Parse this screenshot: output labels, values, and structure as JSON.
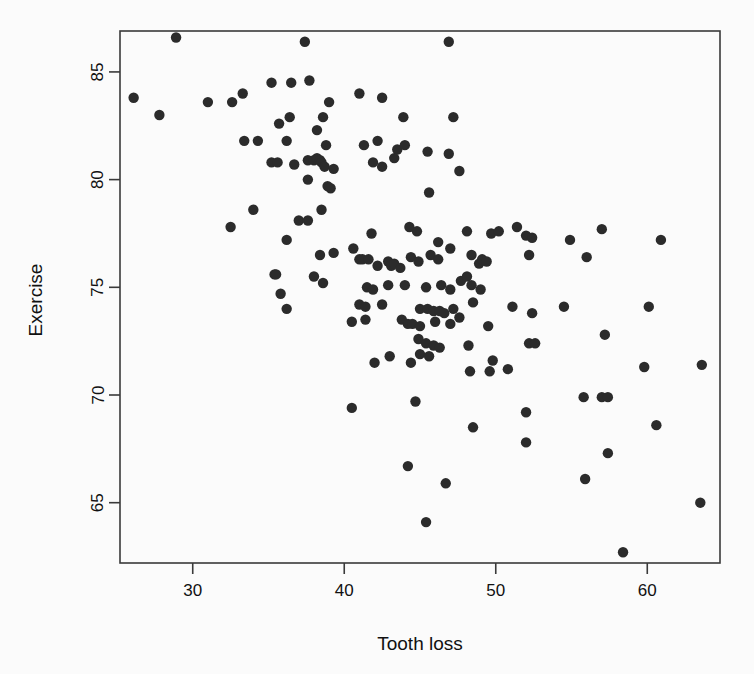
{
  "chart_data": {
    "type": "scatter",
    "title": "",
    "xlabel": "Tooth loss",
    "ylabel": "Exercise",
    "xlim": [
      25.2,
      64.8
    ],
    "ylim": [
      62.2,
      86.9
    ],
    "grid": false,
    "legend": null,
    "xticks": [
      30,
      40,
      50,
      60
    ],
    "yticks": [
      65,
      70,
      75,
      80,
      85
    ],
    "xtick_labels": [
      "30",
      "40",
      "50",
      "60"
    ],
    "ytick_labels": [
      "65",
      "70",
      "75",
      "80",
      "85"
    ],
    "marker": {
      "shape": "circle",
      "color": "#2b2b2b",
      "size": 5.2
    },
    "points": [
      [
        28.9,
        86.6
      ],
      [
        37.4,
        86.4
      ],
      [
        46.9,
        86.4
      ],
      [
        26.1,
        83.8
      ],
      [
        31.0,
        83.6
      ],
      [
        32.6,
        83.6
      ],
      [
        33.3,
        84.0
      ],
      [
        35.2,
        84.5
      ],
      [
        36.5,
        84.5
      ],
      [
        37.7,
        84.6
      ],
      [
        39.0,
        83.6
      ],
      [
        41.0,
        84.0
      ],
      [
        42.5,
        83.8
      ],
      [
        27.8,
        83.0
      ],
      [
        35.7,
        82.6
      ],
      [
        36.4,
        82.9
      ],
      [
        38.2,
        82.3
      ],
      [
        38.6,
        82.9
      ],
      [
        43.9,
        82.9
      ],
      [
        47.2,
        82.9
      ],
      [
        33.4,
        81.8
      ],
      [
        34.3,
        81.8
      ],
      [
        36.2,
        81.8
      ],
      [
        38.8,
        81.6
      ],
      [
        41.3,
        81.6
      ],
      [
        42.2,
        81.8
      ],
      [
        43.5,
        81.4
      ],
      [
        44.0,
        81.6
      ],
      [
        45.5,
        81.3
      ],
      [
        46.9,
        81.2
      ],
      [
        35.2,
        80.8
      ],
      [
        35.6,
        80.8
      ],
      [
        36.7,
        80.7
      ],
      [
        37.6,
        80.9
      ],
      [
        38.0,
        80.9
      ],
      [
        38.2,
        81.0
      ],
      [
        38.4,
        80.9
      ],
      [
        38.5,
        80.8
      ],
      [
        38.7,
        80.6
      ],
      [
        39.3,
        80.5
      ],
      [
        41.9,
        80.8
      ],
      [
        42.5,
        80.6
      ],
      [
        43.3,
        81.0
      ],
      [
        47.6,
        80.4
      ],
      [
        37.6,
        80.0
      ],
      [
        38.9,
        79.7
      ],
      [
        39.1,
        79.6
      ],
      [
        45.6,
        79.4
      ],
      [
        34.0,
        78.6
      ],
      [
        38.5,
        78.6
      ],
      [
        37.0,
        78.1
      ],
      [
        37.6,
        78.1
      ],
      [
        32.5,
        77.8
      ],
      [
        36.2,
        77.2
      ],
      [
        41.8,
        77.5
      ],
      [
        44.3,
        77.8
      ],
      [
        44.8,
        77.6
      ],
      [
        46.2,
        77.1
      ],
      [
        48.1,
        77.6
      ],
      [
        49.7,
        77.5
      ],
      [
        50.2,
        77.6
      ],
      [
        51.4,
        77.8
      ],
      [
        52.0,
        77.4
      ],
      [
        52.4,
        77.3
      ],
      [
        54.9,
        77.2
      ],
      [
        57.0,
        77.7
      ],
      [
        60.9,
        77.2
      ],
      [
        35.4,
        75.6
      ],
      [
        35.5,
        75.6
      ],
      [
        38.0,
        75.5
      ],
      [
        38.4,
        76.5
      ],
      [
        39.3,
        76.6
      ],
      [
        40.6,
        76.8
      ],
      [
        41.0,
        76.3
      ],
      [
        41.2,
        76.3
      ],
      [
        41.6,
        76.3
      ],
      [
        42.2,
        76.0
      ],
      [
        42.9,
        76.2
      ],
      [
        43.1,
        76.0
      ],
      [
        43.3,
        76.1
      ],
      [
        43.7,
        75.9
      ],
      [
        44.4,
        76.4
      ],
      [
        44.9,
        76.2
      ],
      [
        45.7,
        76.5
      ],
      [
        46.2,
        76.3
      ],
      [
        47.0,
        76.8
      ],
      [
        48.4,
        76.5
      ],
      [
        48.9,
        76.1
      ],
      [
        49.1,
        76.3
      ],
      [
        49.4,
        76.2
      ],
      [
        52.2,
        76.5
      ],
      [
        56.0,
        76.4
      ],
      [
        38.6,
        75.2
      ],
      [
        41.5,
        75.0
      ],
      [
        41.9,
        74.9
      ],
      [
        42.9,
        75.1
      ],
      [
        44.0,
        75.1
      ],
      [
        45.4,
        75.0
      ],
      [
        46.4,
        75.1
      ],
      [
        47.0,
        74.9
      ],
      [
        47.7,
        75.3
      ],
      [
        48.1,
        75.5
      ],
      [
        48.4,
        75.1
      ],
      [
        49.0,
        74.9
      ],
      [
        35.8,
        74.7
      ],
      [
        36.2,
        74.0
      ],
      [
        41.0,
        74.2
      ],
      [
        41.4,
        74.1
      ],
      [
        42.5,
        74.2
      ],
      [
        45.0,
        74.0
      ],
      [
        45.5,
        74.0
      ],
      [
        45.9,
        73.9
      ],
      [
        46.3,
        73.9
      ],
      [
        46.6,
        73.8
      ],
      [
        47.2,
        74.0
      ],
      [
        47.6,
        73.6
      ],
      [
        48.5,
        74.3
      ],
      [
        51.1,
        74.1
      ],
      [
        52.4,
        73.8
      ],
      [
        54.5,
        74.1
      ],
      [
        60.1,
        74.1
      ],
      [
        40.5,
        73.4
      ],
      [
        41.4,
        73.5
      ],
      [
        43.8,
        73.5
      ],
      [
        44.2,
        73.3
      ],
      [
        44.5,
        73.3
      ],
      [
        45.0,
        73.2
      ],
      [
        46.0,
        73.4
      ],
      [
        47.0,
        73.3
      ],
      [
        49.5,
        73.2
      ],
      [
        44.9,
        72.6
      ],
      [
        45.4,
        72.4
      ],
      [
        45.9,
        72.3
      ],
      [
        46.3,
        72.2
      ],
      [
        48.2,
        72.3
      ],
      [
        52.2,
        72.4
      ],
      [
        52.6,
        72.4
      ],
      [
        57.2,
        72.8
      ],
      [
        42.0,
        71.5
      ],
      [
        43.0,
        71.8
      ],
      [
        44.4,
        71.5
      ],
      [
        45.0,
        71.9
      ],
      [
        45.6,
        71.8
      ],
      [
        48.3,
        71.1
      ],
      [
        49.6,
        71.1
      ],
      [
        49.8,
        71.6
      ],
      [
        50.8,
        71.2
      ],
      [
        59.8,
        71.3
      ],
      [
        63.6,
        71.4
      ],
      [
        40.5,
        69.4
      ],
      [
        44.7,
        69.7
      ],
      [
        52.0,
        69.2
      ],
      [
        55.8,
        69.9
      ],
      [
        57.0,
        69.9
      ],
      [
        57.4,
        69.9
      ],
      [
        48.5,
        68.5
      ],
      [
        60.6,
        68.6
      ],
      [
        52.0,
        67.8
      ],
      [
        57.4,
        67.3
      ],
      [
        44.2,
        66.7
      ],
      [
        46.7,
        65.9
      ],
      [
        55.9,
        66.1
      ],
      [
        45.4,
        64.1
      ],
      [
        63.5,
        65.0
      ],
      [
        58.4,
        62.7
      ]
    ]
  },
  "axes": {
    "x_axis_label": "Tooth loss",
    "y_axis_label": "Exercise"
  }
}
